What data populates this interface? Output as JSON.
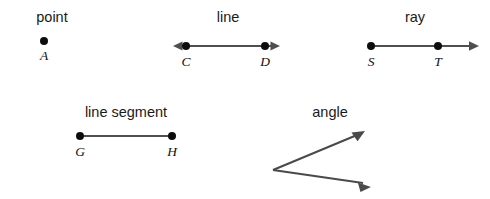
{
  "figure": {
    "background_color": "#ffffff",
    "line_color": "#4f4f4f",
    "dot_color": "#0d0d0d",
    "label_color": "#1a1a1a"
  },
  "items": [
    {
      "id": "point",
      "title": "point",
      "title_x": 52,
      "title_y": 22,
      "kind": "point",
      "points": [
        {
          "label": "A",
          "x": 44,
          "y": 41,
          "label_x": 44,
          "label_y": 60
        }
      ],
      "arrows": []
    },
    {
      "id": "line",
      "title": "line",
      "title_x": 228,
      "title_y": 22,
      "kind": "line",
      "y": 46,
      "x1": 174,
      "x2": 279,
      "points": [
        {
          "label": "C",
          "x": 186,
          "y": 46,
          "label_x": 186,
          "label_y": 66
        },
        {
          "label": "D",
          "x": 265,
          "y": 46,
          "label_x": 265,
          "label_y": 66
        }
      ],
      "arrows": [
        "left",
        "right"
      ]
    },
    {
      "id": "ray",
      "title": "ray",
      "title_x": 415,
      "title_y": 22,
      "kind": "ray",
      "y": 46,
      "x1": 371,
      "x2": 478,
      "points": [
        {
          "label": "S",
          "x": 371,
          "y": 46,
          "label_x": 371,
          "label_y": 66
        },
        {
          "label": "T",
          "x": 438,
          "y": 46,
          "label_x": 438,
          "label_y": 66
        }
      ],
      "arrows": [
        "right"
      ]
    },
    {
      "id": "line-segment",
      "title": "line segment",
      "title_x": 126,
      "title_y": 117,
      "kind": "segment",
      "y": 136,
      "x1": 80,
      "x2": 172,
      "points": [
        {
          "label": "G",
          "x": 80,
          "y": 136,
          "label_x": 80,
          "label_y": 156
        },
        {
          "label": "H",
          "x": 172,
          "y": 136,
          "label_x": 172,
          "label_y": 156
        }
      ],
      "arrows": []
    },
    {
      "id": "angle",
      "title": "angle",
      "title_x": 330,
      "title_y": 117,
      "kind": "angle",
      "vertex": {
        "x": 273,
        "y": 170
      },
      "rays": [
        {
          "id": "angle-ray-upper",
          "tip_x": 364,
          "tip_y": 132
        },
        {
          "id": "angle-ray-lower",
          "tip_x": 370,
          "tip_y": 186
        }
      ],
      "points": [],
      "arrows": [
        "upper",
        "lower"
      ]
    }
  ]
}
